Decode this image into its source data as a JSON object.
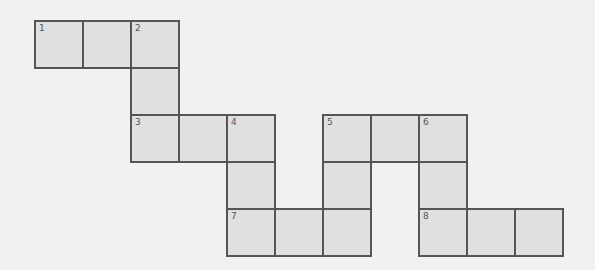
{
  "puzzle": {
    "type": "crossword",
    "origin": {
      "x": 34,
      "y": 20
    },
    "cell_width": 48,
    "cell_height": 47,
    "colors": {
      "background": "#f1f1f1",
      "cell_fill": "#e0e0e0",
      "cell_border": "#555555",
      "number_text": "#555555"
    },
    "cells": [
      {
        "row": 0,
        "col": 0,
        "number": "1"
      },
      {
        "row": 0,
        "col": 1,
        "number": ""
      },
      {
        "row": 0,
        "col": 2,
        "number": "2"
      },
      {
        "row": 1,
        "col": 2,
        "number": ""
      },
      {
        "row": 2,
        "col": 2,
        "number": "3"
      },
      {
        "row": 2,
        "col": 3,
        "number": ""
      },
      {
        "row": 2,
        "col": 4,
        "number": "4"
      },
      {
        "row": 3,
        "col": 4,
        "number": ""
      },
      {
        "row": 4,
        "col": 4,
        "number": "7"
      },
      {
        "row": 4,
        "col": 5,
        "number": ""
      },
      {
        "row": 4,
        "col": 6,
        "number": ""
      },
      {
        "row": 3,
        "col": 6,
        "number": ""
      },
      {
        "row": 2,
        "col": 6,
        "number": "5"
      },
      {
        "row": 2,
        "col": 7,
        "number": ""
      },
      {
        "row": 2,
        "col": 8,
        "number": "6"
      },
      {
        "row": 3,
        "col": 8,
        "number": ""
      },
      {
        "row": 4,
        "col": 8,
        "number": "8"
      },
      {
        "row": 4,
        "col": 9,
        "number": ""
      },
      {
        "row": 4,
        "col": 10,
        "number": ""
      }
    ]
  }
}
